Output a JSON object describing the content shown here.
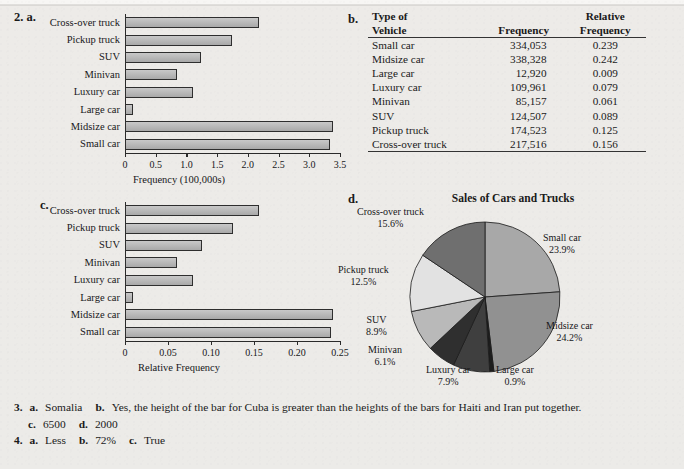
{
  "categories": [
    "Cross-over truck",
    "Pickup truck",
    "SUV",
    "Minivan",
    "Luxury car",
    "Large car",
    "Midsize car",
    "Small car"
  ],
  "part_labels": {
    "a": "2. a.",
    "b": "b.",
    "c": "c.",
    "d": "d."
  },
  "chart_data": [
    {
      "id": "a",
      "type": "bar",
      "orientation": "horizontal",
      "title": "",
      "xlabel": "Frequency (100,000s)",
      "ylabel": "",
      "categories": [
        "Cross-over truck",
        "Pickup truck",
        "SUV",
        "Minivan",
        "Luxury car",
        "Large car",
        "Midsize car",
        "Small car"
      ],
      "values": [
        2.17516,
        1.74523,
        1.24507,
        0.85157,
        1.09961,
        0.1292,
        3.38328,
        3.34053
      ],
      "xlim": [
        0,
        3.5
      ],
      "xticks": [
        0,
        0.5,
        1.0,
        1.5,
        2.0,
        2.5,
        3.0,
        3.5
      ],
      "xticklabels": [
        "0",
        "0.5",
        "1.0",
        "1.5",
        "2.0",
        "2.5",
        "3.0",
        "3.5"
      ],
      "grid": false,
      "bar_color": "#b3b3b3",
      "bar_edge": "#2e2e2e"
    },
    {
      "id": "c",
      "type": "bar",
      "orientation": "horizontal",
      "title": "",
      "xlabel": "Relative Frequency",
      "ylabel": "",
      "categories": [
        "Cross-over truck",
        "Pickup truck",
        "SUV",
        "Minivan",
        "Luxury car",
        "Large car",
        "Midsize car",
        "Small car"
      ],
      "values": [
        0.156,
        0.125,
        0.089,
        0.061,
        0.079,
        0.009,
        0.242,
        0.239
      ],
      "xlim": [
        0,
        0.25
      ],
      "xticks": [
        0,
        0.05,
        0.1,
        0.15,
        0.2,
        0.25
      ],
      "xticklabels": [
        "0",
        "0.05",
        "0.10",
        "0.15",
        "0.20",
        "0.25"
      ],
      "grid": false,
      "bar_color": "#b3b3b3",
      "bar_edge": "#2e2e2e"
    },
    {
      "id": "d",
      "type": "pie",
      "title": "Sales of Cars and Trucks",
      "labels": [
        "Small car",
        "Midsize car",
        "Large car",
        "Luxury car",
        "Minivan",
        "SUV",
        "Pickup truck",
        "Cross-over truck"
      ],
      "values": [
        23.9,
        24.2,
        0.9,
        7.9,
        6.1,
        8.9,
        12.5,
        15.6
      ],
      "value_suffix": "%",
      "start_angle_deg": 0,
      "direction": "clockwise",
      "colors": [
        "#a8a8a8",
        "#919191",
        "#1d1d1d",
        "#3f3f3f",
        "#2f2f2f",
        "#b9b9b9",
        "#e2e2e2",
        "#6f6f6f"
      ],
      "legend": "labels-outside"
    }
  ],
  "table": {
    "label": "b.",
    "headers": {
      "col1_line1": "Type of",
      "col1_line2": "Vehicle",
      "col2_line1": "",
      "col2_line2": "Frequency",
      "col3_line1": "Relative",
      "col3_line2": "Frequency"
    },
    "rows": [
      {
        "vehicle": "Small car",
        "frequency": "334,053",
        "relative": "0.239"
      },
      {
        "vehicle": "Midsize car",
        "frequency": "338,328",
        "relative": "0.242"
      },
      {
        "vehicle": "Large car",
        "frequency": "12,920",
        "relative": "0.009"
      },
      {
        "vehicle": "Luxury car",
        "frequency": "109,961",
        "relative": "0.079"
      },
      {
        "vehicle": "Minivan",
        "frequency": "85,157",
        "relative": "0.061"
      },
      {
        "vehicle": "SUV",
        "frequency": "124,507",
        "relative": "0.089"
      },
      {
        "vehicle": "Pickup truck",
        "frequency": "174,523",
        "relative": "0.125"
      },
      {
        "vehicle": "Cross-over truck",
        "frequency": "217,516",
        "relative": "0.156"
      }
    ]
  },
  "pie_labels": [
    {
      "name": "Small car",
      "pct": "23.9%"
    },
    {
      "name": "Midsize car",
      "pct": "24.2%"
    },
    {
      "name": "Large car",
      "pct": "0.9%"
    },
    {
      "name": "Luxury car",
      "pct": "7.9%"
    },
    {
      "name": "Minivan",
      "pct": "6.1%"
    },
    {
      "name": "SUV",
      "pct": "8.9%"
    },
    {
      "name": "Pickup truck",
      "pct": "12.5%"
    },
    {
      "name": "Cross-over truck",
      "pct": "15.6%"
    }
  ],
  "answers": {
    "q3": {
      "number": "3.",
      "a_label": "a.",
      "a_text": "Somalia",
      "b_label": "b.",
      "b_text": "Yes, the height of the bar for Cuba is greater than the heights of the bars for Haiti and Iran put together.",
      "c_label": "c.",
      "c_text": "6500",
      "d_label": "d.",
      "d_text": "2000"
    },
    "q4": {
      "number": "4.",
      "a_label": "a.",
      "a_text": "Less",
      "b_label": "b.",
      "b_text": "72%",
      "c_label": "c.",
      "c_text": "True"
    }
  }
}
